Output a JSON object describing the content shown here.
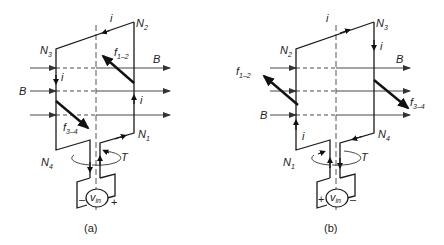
{
  "figures": [
    {
      "caption": "(a)",
      "nodes": {
        "n1": "N",
        "n1_sub": "1",
        "n2": "N",
        "n2_sub": "2",
        "n3": "N",
        "n3_sub": "3",
        "n4": "N",
        "n4_sub": "4"
      },
      "labels": {
        "current": "i",
        "force_12": "f",
        "force_12_sub": "1–2",
        "force_34": "f",
        "force_34_sub": "3–4",
        "field": "B",
        "torque": "T",
        "source": "v",
        "source_sub": "in",
        "minus": "–",
        "plus": "+"
      }
    },
    {
      "caption": "(b)",
      "nodes": {
        "n1": "N",
        "n1_sub": "1",
        "n2": "N",
        "n2_sub": "2",
        "n3": "N",
        "n3_sub": "3",
        "n4": "N",
        "n4_sub": "4"
      },
      "labels": {
        "current": "i",
        "force_12": "f",
        "force_12_sub": "1–2",
        "force_34": "f",
        "force_34_sub": "3–4",
        "field": "B",
        "torque": "T",
        "source": "v",
        "source_sub": "in",
        "minus": "–",
        "plus": "+"
      }
    }
  ]
}
